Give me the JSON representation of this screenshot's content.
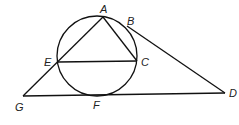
{
  "diagram": {
    "type": "geometry",
    "stroke_color": "#111111",
    "circle": {
      "cx": 97,
      "cy": 56,
      "r": 40
    },
    "points": {
      "A": {
        "label": "A",
        "x": 103,
        "y": 17,
        "lx": 100,
        "ly": 13
      },
      "B": {
        "label": "B",
        "x": 127,
        "y": 25,
        "lx": 127,
        "ly": 25
      },
      "C": {
        "label": "C",
        "x": 137,
        "y": 61,
        "lx": 141,
        "ly": 66
      },
      "E": {
        "label": "E",
        "x": 58,
        "y": 62,
        "lx": 44,
        "ly": 66
      },
      "F": {
        "label": "F",
        "x": 97,
        "y": 95,
        "lx": 93,
        "ly": 109
      },
      "G": {
        "label": "G",
        "x": 23,
        "y": 96,
        "lx": 15,
        "ly": 111
      },
      "D": {
        "label": "D",
        "x": 225,
        "y": 93,
        "lx": 229,
        "ly": 97
      }
    },
    "segments": [
      [
        "A",
        "G"
      ],
      [
        "A",
        "C"
      ],
      [
        "E",
        "C"
      ],
      [
        "G",
        "D"
      ],
      [
        "B",
        "D"
      ]
    ]
  }
}
